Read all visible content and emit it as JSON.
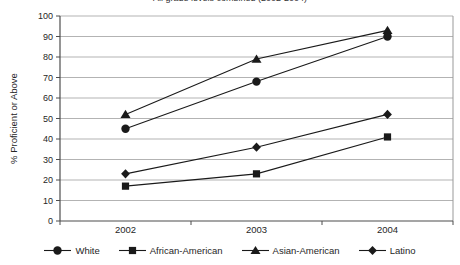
{
  "chart_data": {
    "type": "line",
    "title": "All grade levels combined (2002-2004)",
    "categories": [
      "2002",
      "2003",
      "2004"
    ],
    "series": [
      {
        "name": "White",
        "marker": "circle",
        "values": [
          45,
          68,
          90
        ]
      },
      {
        "name": "African-American",
        "marker": "square",
        "values": [
          17,
          23,
          41
        ]
      },
      {
        "name": "Asian-American",
        "marker": "triangle",
        "values": [
          52,
          79,
          93
        ]
      },
      {
        "name": "Latino",
        "marker": "diamond",
        "values": [
          23,
          36,
          52
        ]
      }
    ],
    "xlabel": "",
    "ylabel": "% Proficient or Above",
    "ylim": [
      0,
      100
    ],
    "ytick_step": 10,
    "yticks": [
      "100",
      "90",
      "80",
      "70",
      "60",
      "50",
      "40",
      "30",
      "20",
      "10",
      "0"
    ],
    "grid": true,
    "legend_position": "bottom",
    "colors": {
      "series": "#1a1a1a",
      "grid": "#b3b3b3",
      "axis": "#4d4d4d",
      "border": "#999999",
      "text": "#262626"
    }
  }
}
